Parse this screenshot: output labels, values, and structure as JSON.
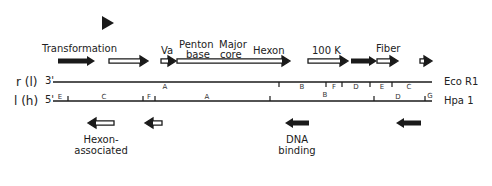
{
  "figure": {
    "type": "adenovirus transcription/restriction map",
    "marker": {
      "shape": "triangle-right",
      "x": 102,
      "y": 16
    }
  },
  "top_genes": [
    {
      "label": "Transformation",
      "x1": 58,
      "x2": 95,
      "style": "solid",
      "label_x": 42,
      "label_y": 44
    },
    {
      "label": "",
      "x1": 109,
      "x2": 148,
      "style": "open"
    },
    {
      "label": "Va",
      "x1": 161,
      "x2": 176,
      "style": "open",
      "label_x": 161,
      "label_y": 44
    },
    {
      "label": "",
      "x1": 177,
      "x2": 290,
      "style": "open"
    },
    {
      "label": "",
      "x1": 308,
      "x2": 348,
      "style": "open"
    },
    {
      "label": "",
      "x1": 351,
      "x2": 377,
      "style": "solid"
    },
    {
      "label": "",
      "x1": 377,
      "x2": 398,
      "style": "open"
    },
    {
      "label": "",
      "x1": 420,
      "x2": 432,
      "style": "open-short"
    }
  ],
  "top_labels": {
    "transformation": "Transformation",
    "va": "Va",
    "penton_line1": "Penton",
    "penton_line2": "base",
    "major_line1": "Major",
    "major_line2": "core",
    "hexon": "Hexon",
    "k100": "100 K",
    "fiber": "Fiber"
  },
  "strands": {
    "r": {
      "label": "r (l)",
      "prime": "3'",
      "enzyme": "Eco R1",
      "y": 82
    },
    "l": {
      "label": "l (h)",
      "prime": "5'",
      "enzyme": "Hpa 1",
      "y": 101
    }
  },
  "eco_r1": {
    "ticks": [
      279,
      326,
      342,
      370,
      392
    ],
    "fragments": [
      {
        "label": "A",
        "x": 165
      },
      {
        "label": "B",
        "x": 302
      },
      {
        "label": "F",
        "x": 334
      },
      {
        "label": "D",
        "x": 356
      },
      {
        "label": "E",
        "x": 382
      },
      {
        "label": "C",
        "x": 409
      }
    ]
  },
  "hpa_1": {
    "ticks": [
      68,
      143,
      155,
      270,
      374,
      425
    ],
    "fragments": [
      {
        "label": "E",
        "x": 60,
        "y": 94
      },
      {
        "label": "C",
        "x": 104,
        "y": 94
      },
      {
        "label": "F",
        "x": 149,
        "y": 94
      },
      {
        "label": "A",
        "x": 207,
        "y": 94
      },
      {
        "label": "B",
        "x": 325,
        "y": 92
      },
      {
        "label": "D",
        "x": 398,
        "y": 94
      },
      {
        "label": "G",
        "x": 430,
        "y": 93
      }
    ]
  },
  "bottom_genes": [
    {
      "label_line1": "Hexon-",
      "label_line2": "associated",
      "x1": 88,
      "x2": 114,
      "style": "open"
    },
    {
      "label_line1": "",
      "label_line2": "",
      "x1": 145,
      "x2": 162,
      "style": "open"
    },
    {
      "label_line1": "DNA",
      "label_line2": "binding",
      "x1": 285,
      "x2": 309,
      "style": "solid"
    },
    {
      "label_line1": "",
      "label_line2": "",
      "x1": 396,
      "x2": 421,
      "style": "solid"
    }
  ],
  "colors": {
    "ink": "#1a1a1a",
    "background": "#ffffff"
  }
}
